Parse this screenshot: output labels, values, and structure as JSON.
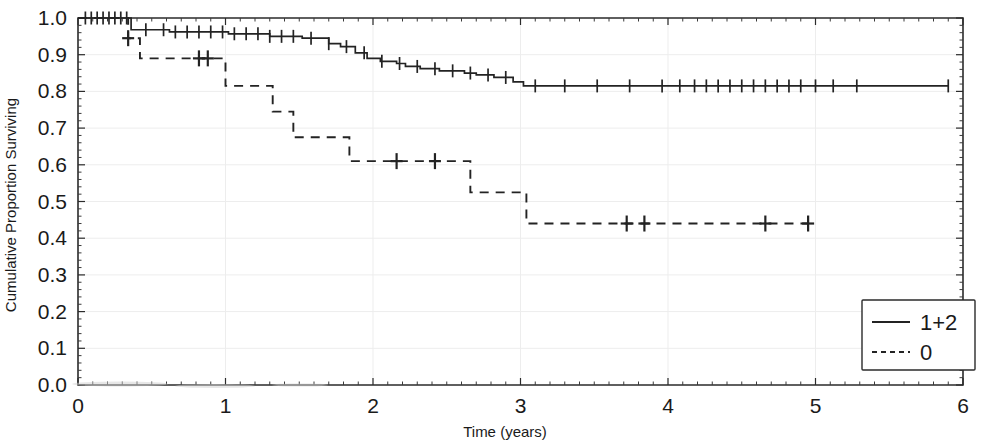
{
  "chart_data": {
    "type": "line",
    "subtype": "kaplan-meier-step",
    "title": "",
    "xlabel": "Time (years)",
    "ylabel": "Cumulative Proportion Surviving",
    "xlim": [
      0,
      6
    ],
    "ylim": [
      0.0,
      1.0
    ],
    "xticks": [
      0,
      1,
      2,
      3,
      4,
      5,
      6
    ],
    "xticklabels": [
      "0",
      "1",
      "2",
      "3",
      "4",
      "5",
      "6"
    ],
    "yticks": [
      0.0,
      0.1,
      0.2,
      0.3,
      0.4,
      0.5,
      0.6,
      0.7,
      0.8,
      0.9,
      1.0
    ],
    "yticklabels": [
      "0.0",
      "0.1",
      "0.2",
      "0.3",
      "0.4",
      "0.5",
      "0.6",
      "0.7",
      "0.8",
      "0.9",
      "1.0"
    ],
    "grid": true,
    "legend_position": "lower right",
    "series": [
      {
        "name": "1+2",
        "linestyle": "solid",
        "color": "#232323",
        "steps": [
          [
            0.0,
            1.0
          ],
          [
            0.08,
            1.0
          ],
          [
            0.3,
            1.0
          ],
          [
            0.36,
            0.968
          ],
          [
            0.52,
            0.968
          ],
          [
            0.62,
            0.962
          ],
          [
            0.95,
            0.962
          ],
          [
            1.02,
            0.957
          ],
          [
            1.18,
            0.957
          ],
          [
            1.3,
            0.95
          ],
          [
            1.42,
            0.95
          ],
          [
            1.52,
            0.945
          ],
          [
            1.62,
            0.945
          ],
          [
            1.7,
            0.93
          ],
          [
            1.78,
            0.922
          ],
          [
            1.88,
            0.905
          ],
          [
            1.96,
            0.89
          ],
          [
            2.05,
            0.882
          ],
          [
            2.16,
            0.876
          ],
          [
            2.22,
            0.868
          ],
          [
            2.32,
            0.862
          ],
          [
            2.45,
            0.856
          ],
          [
            2.62,
            0.85
          ],
          [
            2.7,
            0.845
          ],
          [
            2.82,
            0.838
          ],
          [
            2.95,
            0.826
          ],
          [
            3.02,
            0.815
          ],
          [
            4.2,
            0.815
          ],
          [
            5.1,
            0.815
          ],
          [
            5.9,
            0.815
          ]
        ],
        "censor_times": [
          0.05,
          0.09,
          0.13,
          0.17,
          0.21,
          0.25,
          0.29,
          0.33,
          0.46,
          0.58,
          0.66,
          0.74,
          0.82,
          0.9,
          0.98,
          1.06,
          1.14,
          1.22,
          1.3,
          1.38,
          1.46,
          1.58,
          1.7,
          1.82,
          1.94,
          2.06,
          2.18,
          2.3,
          2.42,
          2.54,
          2.66,
          2.78,
          2.9,
          3.1,
          3.3,
          3.52,
          3.74,
          3.96,
          4.08,
          4.18,
          4.26,
          4.34,
          4.42,
          4.5,
          4.58,
          4.66,
          4.74,
          4.82,
          4.9,
          5.0,
          5.12,
          5.28,
          5.9
        ]
      },
      {
        "name": "0",
        "linestyle": "dashed",
        "color": "#232323",
        "steps": [
          [
            0.0,
            1.0
          ],
          [
            0.3,
            1.0
          ],
          [
            0.34,
            0.945
          ],
          [
            0.4,
            0.945
          ],
          [
            0.42,
            0.89
          ],
          [
            0.98,
            0.89
          ],
          [
            1.0,
            0.815
          ],
          [
            1.28,
            0.815
          ],
          [
            1.32,
            0.745
          ],
          [
            1.42,
            0.745
          ],
          [
            1.46,
            0.675
          ],
          [
            1.8,
            0.675
          ],
          [
            1.84,
            0.61
          ],
          [
            2.62,
            0.61
          ],
          [
            2.66,
            0.525
          ],
          [
            3.0,
            0.525
          ],
          [
            3.04,
            0.44
          ],
          [
            4.95,
            0.44
          ]
        ],
        "censor_times": [
          0.34,
          0.82,
          0.88,
          2.16,
          2.42,
          3.72,
          3.84,
          4.66,
          4.95
        ]
      }
    ]
  },
  "legend": {
    "entries": [
      {
        "label": "1+2",
        "style": "solid"
      },
      {
        "label": "0",
        "style": "dashed"
      }
    ]
  }
}
